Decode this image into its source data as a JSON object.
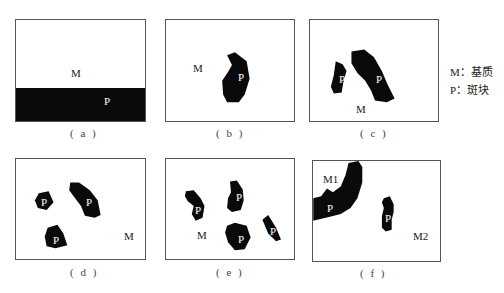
{
  "legend": {
    "items": [
      {
        "key": "M",
        "sep": "：",
        "text": "基质"
      },
      {
        "key": "P",
        "sep": "：",
        "text": "斑块"
      }
    ]
  },
  "panels": [
    {
      "id": "a",
      "caption": "( a )",
      "labels": [
        {
          "text": "M"
        },
        {
          "text": "P"
        }
      ]
    },
    {
      "id": "b",
      "caption": "( b )",
      "labels": [
        {
          "text": "M"
        },
        {
          "text": "P"
        }
      ]
    },
    {
      "id": "c",
      "caption": "( c )",
      "labels": [
        {
          "text": "P"
        },
        {
          "text": "P"
        },
        {
          "text": "M"
        }
      ]
    },
    {
      "id": "d",
      "caption": "( d )",
      "labels": [
        {
          "text": "P"
        },
        {
          "text": "P"
        },
        {
          "text": "P"
        },
        {
          "text": "M"
        }
      ]
    },
    {
      "id": "e",
      "caption": "( e )",
      "labels": [
        {
          "text": "P"
        },
        {
          "text": "P"
        },
        {
          "text": "P"
        },
        {
          "text": "P"
        },
        {
          "text": "M"
        }
      ]
    },
    {
      "id": "f",
      "caption": "( f )",
      "labels": [
        {
          "text": "M1"
        },
        {
          "text": "P"
        },
        {
          "text": "P"
        },
        {
          "text": "M2"
        }
      ]
    }
  ],
  "colors": {
    "patch": "#0a0a0a",
    "matrix": "#ffffff",
    "border": "#555555"
  }
}
